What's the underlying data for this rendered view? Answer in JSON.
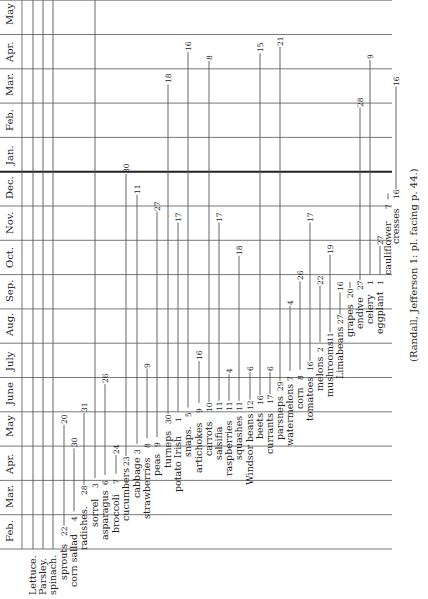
{
  "chart_data": {
    "type": "timeline",
    "orientation": "rotated 90° counter-clockwise; months run bottom-to-top along the left edge",
    "axis": {
      "months": [
        "Feb.",
        "Mar.",
        "Apr.",
        "May",
        "June",
        "July",
        "Aug.",
        "Sep.",
        "Oct.",
        "Nov.",
        "Dec.",
        "Jan.",
        "Feb.",
        "Mar.",
        "Apr.",
        "May"
      ],
      "year_break_after": "Dec."
    },
    "series": [
      {
        "name": "Lettuce.",
        "start": "full",
        "end": "full"
      },
      {
        "name": "Parsley.",
        "start": "full",
        "end": "full"
      },
      {
        "name": "spinach.",
        "start": "full",
        "end": "full"
      },
      {
        "name": "sprouts",
        "start": {
          "month": "Feb.",
          "day": 22
        },
        "end": {
          "month": "May",
          "day": 20
        }
      },
      {
        "name": "corn sallad",
        "start": {
          "month": "Mar.",
          "day": 4
        },
        "end": {
          "month": "Apr.",
          "day": 30
        }
      },
      {
        "name": "radishes.",
        "start": {
          "month": "Mar.",
          "day": 28
        },
        "end": {
          "month": "May",
          "day": 31
        }
      },
      {
        "name": "sorrel",
        "start": {
          "month": "Apr.",
          "day": 3
        },
        "end": "full (to May)"
      },
      {
        "name": "asparagus",
        "start": {
          "month": "Apr.",
          "day": 6
        },
        "end": {
          "month": "June",
          "day": 26
        }
      },
      {
        "name": "broccoli",
        "start": {
          "month": "Apr.",
          "day": 7
        },
        "end": {
          "month": "Apr.",
          "day": 24
        }
      },
      {
        "name": "cucumbers",
        "start": {
          "month": "Apr.",
          "day": 23
        },
        "end": {
          "month": "Dec.",
          "day": 30
        }
      },
      {
        "name": "cabbage",
        "start": {
          "month": "May",
          "day": 3
        },
        "end": {
          "month": "Dec.",
          "day": 11
        }
      },
      {
        "name": "strawberries",
        "start": {
          "month": "May",
          "day": 8
        },
        "end": {
          "month": "July",
          "day": 9
        }
      },
      {
        "name": "peas",
        "start": {
          "month": "May",
          "day": 9
        },
        "end": {
          "month": "Nov.",
          "day": 27
        }
      },
      {
        "name": "turneps",
        "start": {
          "month": "May",
          "day": 30
        },
        "end": {
          "month": "Mar.",
          "day": 18
        }
      },
      {
        "name": "potato Irish",
        "start": {
          "month": "June",
          "day": 1
        },
        "end": {
          "month": "Nov.",
          "day": 17
        }
      },
      {
        "name": "snaps.",
        "start": {
          "month": "June",
          "day": 5
        },
        "end": {
          "month": "Apr.",
          "day": 16
        }
      },
      {
        "name": "artichokes",
        "start": {
          "month": "June",
          "day": 9
        },
        "end": {
          "month": "July",
          "day": 16
        }
      },
      {
        "name": "carrots",
        "start": {
          "month": "June",
          "day": 10
        },
        "end": {
          "month": "Apr.",
          "day": 8
        }
      },
      {
        "name": "salsifia",
        "start": {
          "month": "June",
          "day": 11
        },
        "end": {
          "month": "Nov.",
          "day": 17
        }
      },
      {
        "name": "raspberries",
        "start": {
          "month": "June",
          "day": 11
        },
        "end": {
          "month": "July",
          "day": 4
        }
      },
      {
        "name": "squashes",
        "start": {
          "month": "June",
          "day": 11
        },
        "end": {
          "month": "Oct.",
          "day": 18
        }
      },
      {
        "name": "Windsor beans",
        "start": {
          "month": "June",
          "day": 12
        },
        "end": {
          "month": "July",
          "day": 6
        }
      },
      {
        "name": "beets",
        "start": {
          "month": "June",
          "day": 16
        },
        "end": {
          "month": "Apr.",
          "day": 15
        }
      },
      {
        "name": "currants",
        "start": {
          "month": "June",
          "day": 17
        },
        "end": {
          "month": "July",
          "day": 6
        }
      },
      {
        "name": "parsneps",
        "start": {
          "month": "June",
          "day": 29
        },
        "end": {
          "month": "Apr.",
          "day": 21
        }
      },
      {
        "name": "watermelons",
        "start": {
          "month": "July",
          "day": 7
        },
        "end": {
          "month": "Sep.",
          "day": 4
        }
      },
      {
        "name": "corn",
        "start": {
          "month": "July",
          "day": 8
        },
        "end": {
          "month": "Sep.",
          "day": 26
        }
      },
      {
        "name": "tomatoes",
        "start": {
          "month": "July",
          "day": 16
        },
        "end": {
          "month": "Nov.",
          "day": 17
        }
      },
      {
        "name": "melons",
        "start": {
          "month": "Aug.",
          "day": 2
        },
        "end": {
          "month": "Sep.",
          "day": 22
        }
      },
      {
        "name": "mushrooms",
        "start": {
          "month": "Aug.",
          "day": 11
        },
        "end": {
          "month": "Oct.",
          "day": 19
        }
      },
      {
        "name": "Limabeans",
        "start": {
          "month": "Aug.",
          "day": 27
        },
        "end": {
          "month": "Sep.",
          "day": 16
        }
      },
      {
        "name": "grapes",
        "start": {
          "month": "Sep.",
          "day": 20
        },
        "end": "—"
      },
      {
        "name": "endive",
        "start": {
          "month": "Sep.",
          "day": 27
        },
        "end": {
          "month": "Feb.",
          "day": 28
        }
      },
      {
        "name": "celery",
        "start": {
          "month": "Oct.",
          "day": 1
        },
        "end": {
          "month": "Apr.",
          "day": 9
        }
      },
      {
        "name": "eggplant",
        "start": {
          "month": "Oct.",
          "day": 1
        },
        "end": {
          "month": "Oct.",
          "day": 27
        }
      },
      {
        "name": "cauliflower",
        "start": {
          "month": "Dec.",
          "day": 7
        },
        "end": "—"
      },
      {
        "name": "cresses",
        "start": {
          "month": "Dec.",
          "day": 16
        },
        "end": {
          "month": "Mar.",
          "day": 16
        }
      }
    ],
    "citation": "(Randall, Jefferson 1: pl. facing p. 44.)"
  },
  "citation": "(Randall, Jefferson 1: pl. facing p. 44.)",
  "grid": {
    "line_color": "#555555",
    "thick_line_color": "#222222"
  }
}
